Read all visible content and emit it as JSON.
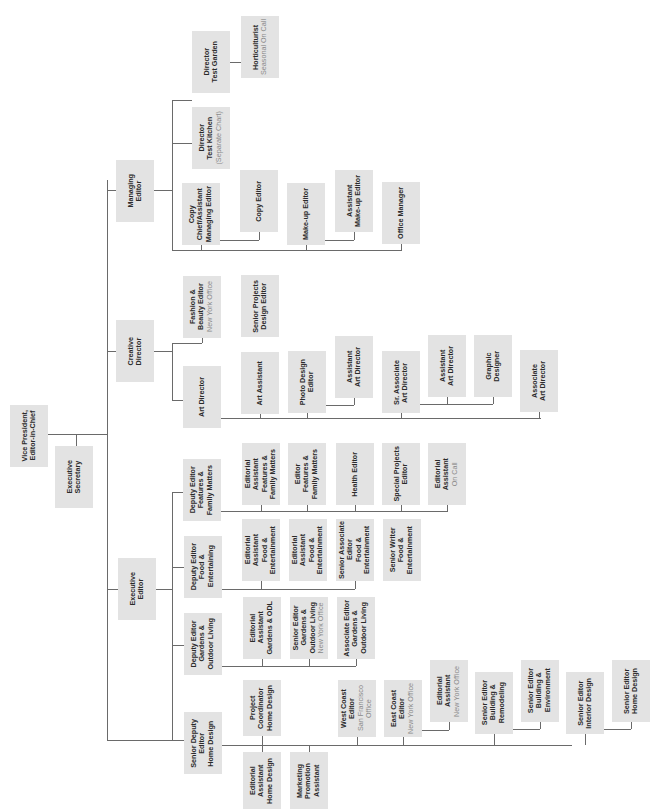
{
  "diagram": {
    "orientation": "rotated 90 degrees counterclockwise (text reads bottom-to-top)",
    "box_color": "#e3e3e3",
    "line_color": "#6a6a6a",
    "text_color": "#2a2a2a",
    "subtext_color": "#8a8a8a"
  },
  "nodes": [
    {
      "id": "vp",
      "title": "Vice President,\nEditor-in-Chief",
      "sub": "",
      "x": 10,
      "y": 405,
      "w": 38,
      "h": 62,
      "parent": null
    },
    {
      "id": "exec-sec",
      "title": "Executive\nSecretary",
      "sub": "",
      "x": 55,
      "y": 446,
      "w": 38,
      "h": 62,
      "parent": "vp"
    },
    {
      "id": "managing-editor",
      "title": "Managing\nEditor",
      "sub": "",
      "x": 116,
      "y": 160,
      "w": 38,
      "h": 62,
      "parent": "vp"
    },
    {
      "id": "creative-director",
      "title": "Creative\nDirector",
      "sub": "",
      "x": 116,
      "y": 320,
      "w": 38,
      "h": 62,
      "parent": "vp"
    },
    {
      "id": "executive-editor",
      "title": "Executive\nEditor",
      "sub": "",
      "x": 118,
      "y": 558,
      "w": 38,
      "h": 62,
      "parent": "vp"
    },
    {
      "id": "senior-deputy-home",
      "title": "Senior Deputy\nEditor\nHome Design",
      "sub": "",
      "x": 184,
      "y": 712,
      "w": 38,
      "h": 62,
      "parent": "executive-editor"
    },
    {
      "id": "dir-test-kitchen",
      "title": "Director\nTest Kitchen",
      "sub": "(Separate Chart)",
      "x": 192,
      "y": 107,
      "w": 38,
      "h": 62,
      "parent": "managing-editor"
    },
    {
      "id": "dir-test-garden",
      "title": "Director\nTest Garden",
      "sub": "",
      "x": 192,
      "y": 31,
      "w": 38,
      "h": 62,
      "parent": "managing-editor"
    },
    {
      "id": "horticulturist",
      "title": "Horticulturist",
      "sub": "Seasonal On Call",
      "x": 241,
      "y": 16,
      "w": 38,
      "h": 62,
      "parent": "dir-test-garden"
    },
    {
      "id": "copy-chief",
      "title": "Copy\nChief/Assistant\nManaging Editor",
      "sub": "",
      "x": 182,
      "y": 183,
      "w": 38,
      "h": 62,
      "parent": "managing-editor"
    },
    {
      "id": "copy-editor",
      "title": "Copy Editor",
      "sub": "",
      "x": 240,
      "y": 170,
      "w": 38,
      "h": 62,
      "parent": "copy-chief"
    },
    {
      "id": "makeup-editor",
      "title": "Make-up Editor",
      "sub": "",
      "x": 287,
      "y": 183,
      "w": 38,
      "h": 62,
      "parent": "managing-editor"
    },
    {
      "id": "asst-makeup-editor",
      "title": "Assistant\nMake-up Editor",
      "sub": "",
      "x": 335,
      "y": 170,
      "w": 38,
      "h": 62,
      "parent": "makeup-editor"
    },
    {
      "id": "office-manager",
      "title": "Office Manager",
      "sub": "",
      "x": 382,
      "y": 182,
      "w": 38,
      "h": 62,
      "parent": "managing-editor"
    },
    {
      "id": "fashion-beauty",
      "title": "Fashion &\nBeauty Editor",
      "sub": "New York Office",
      "x": 183,
      "y": 276,
      "w": 38,
      "h": 62,
      "parent": "creative-director"
    },
    {
      "id": "senior-projects-design",
      "title": "Senior Projects\nDesign Editor",
      "sub": "",
      "x": 241,
      "y": 275,
      "w": 38,
      "h": 62,
      "parent": "creative-director"
    },
    {
      "id": "art-director",
      "title": "Art Director",
      "sub": "",
      "x": 183,
      "y": 366,
      "w": 38,
      "h": 62,
      "parent": "creative-director"
    },
    {
      "id": "art-assistant",
      "title": "Art Assistant",
      "sub": "",
      "x": 241,
      "y": 352,
      "w": 38,
      "h": 62,
      "parent": "art-director"
    },
    {
      "id": "photo-design",
      "title": "Photo Design\nEditor",
      "sub": "",
      "x": 288,
      "y": 351,
      "w": 38,
      "h": 62,
      "parent": "art-director"
    },
    {
      "id": "asst-art-director-1",
      "title": "Assistant\nArt Director",
      "sub": "",
      "x": 335,
      "y": 336,
      "w": 38,
      "h": 62,
      "parent": "photo-design"
    },
    {
      "id": "sr-assoc-art-director",
      "title": "Sr. Associate\nArt Director",
      "sub": "",
      "x": 382,
      "y": 351,
      "w": 38,
      "h": 62,
      "parent": "art-director"
    },
    {
      "id": "asst-art-director-2",
      "title": "Assistant\nArt Director",
      "sub": "",
      "x": 428,
      "y": 335,
      "w": 38,
      "h": 62,
      "parent": "sr-assoc-art-director"
    },
    {
      "id": "graphic-designer",
      "title": "Graphic\nDesigner",
      "sub": "",
      "x": 474,
      "y": 335,
      "w": 38,
      "h": 62,
      "parent": "sr-assoc-art-director"
    },
    {
      "id": "assoc-art-director",
      "title": "Associate\nArt Director",
      "sub": "",
      "x": 520,
      "y": 350,
      "w": 38,
      "h": 62,
      "parent": "art-director"
    },
    {
      "id": "dep-features",
      "title": "Deputy Editor\nFeatures &\nFamily Matters",
      "sub": "",
      "x": 183,
      "y": 459,
      "w": 38,
      "h": 62,
      "parent": "executive-editor"
    },
    {
      "id": "ea-features",
      "title": "Editorial\nAssistant\nFeatures &\nFamily Matters",
      "sub": "",
      "x": 242,
      "y": 443,
      "w": 38,
      "h": 62,
      "parent": "dep-features"
    },
    {
      "id": "editor-features",
      "title": "Editor\nFeatures &\nFamily Matters",
      "sub": "",
      "x": 288,
      "y": 443,
      "w": 38,
      "h": 62,
      "parent": "dep-features"
    },
    {
      "id": "health-editor",
      "title": "Health Editor",
      "sub": "",
      "x": 336,
      "y": 443,
      "w": 38,
      "h": 62,
      "parent": "dep-features"
    },
    {
      "id": "special-projects",
      "title": "Special Projects\nEditor",
      "sub": "",
      "x": 382,
      "y": 443,
      "w": 38,
      "h": 62,
      "parent": "dep-features"
    },
    {
      "id": "ea-oncall",
      "title": "Editorial\nAssistant",
      "sub": "On Call",
      "x": 428,
      "y": 443,
      "w": 38,
      "h": 62,
      "parent": "dep-features"
    },
    {
      "id": "dep-food",
      "title": "Deputy Editor\nFood &\nEntertaining",
      "sub": "",
      "x": 184,
      "y": 536,
      "w": 38,
      "h": 62,
      "parent": "executive-editor"
    },
    {
      "id": "ea-food-1",
      "title": "Editorial\nAssistant\nFood &\nEntertainment",
      "sub": "",
      "x": 242,
      "y": 519,
      "w": 38,
      "h": 62,
      "parent": "dep-food"
    },
    {
      "id": "ea-food-2",
      "title": "Editorial\nAssistant\nFood &\nEntertainment",
      "sub": "",
      "x": 289,
      "y": 519,
      "w": 38,
      "h": 62,
      "parent": "dep-food"
    },
    {
      "id": "sr-assoc-food",
      "title": "Senior Associate\nEditor\nFood &\nEntertainment",
      "sub": "",
      "x": 336,
      "y": 519,
      "w": 38,
      "h": 62,
      "parent": "dep-food"
    },
    {
      "id": "sr-writer-food",
      "title": "Senior Writer\nFood &\nEntertainment",
      "sub": "",
      "x": 383,
      "y": 519,
      "w": 38,
      "h": 62,
      "parent": "dep-food"
    },
    {
      "id": "dep-gardens",
      "title": "Deputy Editor\nGardens &\nOutdoor Living",
      "sub": "",
      "x": 184,
      "y": 613,
      "w": 38,
      "h": 62,
      "parent": "executive-editor"
    },
    {
      "id": "ea-gardens",
      "title": "Editorial\nAssistant\nGardens & ODL",
      "sub": "",
      "x": 243,
      "y": 597,
      "w": 38,
      "h": 62,
      "parent": "dep-gardens"
    },
    {
      "id": "sr-editor-gardens",
      "title": "Senior Editor\nGardens &\nOutdoor Living",
      "sub": "New York Office",
      "x": 290,
      "y": 597,
      "w": 38,
      "h": 62,
      "parent": "dep-gardens"
    },
    {
      "id": "assoc-editor-gardens",
      "title": "Associate Editor\nGardens &\nOutdoor Living",
      "sub": "",
      "x": 337,
      "y": 597,
      "w": 38,
      "h": 62,
      "parent": "dep-gardens"
    },
    {
      "id": "project-coord-home",
      "title": "Project\nCoordinator\nHome Design",
      "sub": "",
      "x": 243,
      "y": 680,
      "w": 38,
      "h": 56,
      "parent": "senior-deputy-home"
    },
    {
      "id": "ea-home",
      "title": "Editorial\nAssistant\nHome Design",
      "sub": "",
      "x": 243,
      "y": 752,
      "w": 38,
      "h": 57,
      "parent": "senior-deputy-home"
    },
    {
      "id": "marketing-promo",
      "title": "Marketing\nPromotion\nAssistant",
      "sub": "",
      "x": 290,
      "y": 752,
      "w": 38,
      "h": 57,
      "parent": "senior-deputy-home"
    },
    {
      "id": "west-coast",
      "title": "West Coast Editor",
      "sub": "San Francisco Office",
      "x": 338,
      "y": 680,
      "w": 38,
      "h": 57,
      "parent": "senior-deputy-home"
    },
    {
      "id": "east-coast",
      "title": "East Coast Editor",
      "sub": "New York Office",
      "x": 384,
      "y": 680,
      "w": 38,
      "h": 57,
      "parent": "senior-deputy-home"
    },
    {
      "id": "ea-ny",
      "title": "Editorial Assistant",
      "sub": "New York Office",
      "x": 430,
      "y": 660,
      "w": 38,
      "h": 62,
      "parent": "east-coast"
    },
    {
      "id": "sr-editor-building-remodel",
      "title": "Senior Editor\nBuilding &\nRemodeling",
      "sub": "",
      "x": 475,
      "y": 672,
      "w": 38,
      "h": 62,
      "parent": "senior-deputy-home"
    },
    {
      "id": "sr-editor-building-env",
      "title": "Senior Editor\nBuilding &\nEnvironment",
      "sub": "",
      "x": 521,
      "y": 660,
      "w": 38,
      "h": 62,
      "parent": "sr-editor-building-remodel"
    },
    {
      "id": "sr-editor-interior",
      "title": "Senior Editor\nInterior Design",
      "sub": "",
      "x": 566,
      "y": 672,
      "w": 38,
      "h": 62,
      "parent": "senior-deputy-home"
    },
    {
      "id": "sr-editor-home-design",
      "title": "Senior Editor\nHome Design",
      "sub": "",
      "x": 612,
      "y": 660,
      "w": 38,
      "h": 62,
      "parent": "sr-editor-interior"
    }
  ],
  "connectors": [
    {
      "x": 48,
      "y": 434,
      "w": 60,
      "h": 1
    },
    {
      "x": 76,
      "y": 434,
      "w": 1,
      "h": 12
    },
    {
      "x": 107,
      "y": 180,
      "w": 1,
      "h": 560
    },
    {
      "x": 107,
      "y": 190,
      "w": 9,
      "h": 1
    },
    {
      "x": 107,
      "y": 351,
      "w": 9,
      "h": 1
    },
    {
      "x": 107,
      "y": 589,
      "w": 11,
      "h": 1
    },
    {
      "x": 107,
      "y": 740,
      "w": 77,
      "h": 1
    },
    {
      "x": 154,
      "y": 190,
      "w": 18,
      "h": 1
    },
    {
      "x": 172,
      "y": 100,
      "w": 1,
      "h": 150
    },
    {
      "x": 172,
      "y": 100,
      "w": 20,
      "h": 1
    },
    {
      "x": 172,
      "y": 143,
      "w": 20,
      "h": 1
    },
    {
      "x": 230,
      "y": 62,
      "w": 11,
      "h": 1
    },
    {
      "x": 172,
      "y": 250,
      "w": 230,
      "h": 1
    },
    {
      "x": 201,
      "y": 245,
      "w": 1,
      "h": 5
    },
    {
      "x": 220,
      "y": 240,
      "w": 39,
      "h": 1
    },
    {
      "x": 259,
      "y": 232,
      "w": 1,
      "h": 8
    },
    {
      "x": 306,
      "y": 245,
      "w": 1,
      "h": 5
    },
    {
      "x": 325,
      "y": 240,
      "w": 29,
      "h": 1
    },
    {
      "x": 354,
      "y": 232,
      "w": 1,
      "h": 8
    },
    {
      "x": 401,
      "y": 244,
      "w": 1,
      "h": 6
    },
    {
      "x": 154,
      "y": 351,
      "w": 18,
      "h": 1
    },
    {
      "x": 172,
      "y": 343,
      "w": 1,
      "h": 57
    },
    {
      "x": 172,
      "y": 343,
      "w": 30,
      "h": 1
    },
    {
      "x": 202,
      "y": 338,
      "w": 1,
      "h": 5
    },
    {
      "x": 172,
      "y": 400,
      "w": 11,
      "h": 1
    },
    {
      "x": 221,
      "y": 418,
      "w": 320,
      "h": 1
    },
    {
      "x": 260,
      "y": 414,
      "w": 1,
      "h": 4
    },
    {
      "x": 307,
      "y": 413,
      "w": 1,
      "h": 5
    },
    {
      "x": 326,
      "y": 405,
      "w": 28,
      "h": 1
    },
    {
      "x": 354,
      "y": 398,
      "w": 1,
      "h": 7
    },
    {
      "x": 401,
      "y": 413,
      "w": 1,
      "h": 5
    },
    {
      "x": 420,
      "y": 404,
      "w": 73,
      "h": 1
    },
    {
      "x": 447,
      "y": 397,
      "w": 1,
      "h": 7
    },
    {
      "x": 493,
      "y": 397,
      "w": 1,
      "h": 7
    },
    {
      "x": 539,
      "y": 412,
      "w": 1,
      "h": 6
    },
    {
      "x": 156,
      "y": 589,
      "w": 16,
      "h": 1
    },
    {
      "x": 172,
      "y": 492,
      "w": 1,
      "h": 248
    },
    {
      "x": 172,
      "y": 492,
      "w": 11,
      "h": 1
    },
    {
      "x": 172,
      "y": 567,
      "w": 12,
      "h": 1
    },
    {
      "x": 172,
      "y": 645,
      "w": 12,
      "h": 1
    },
    {
      "x": 221,
      "y": 511,
      "w": 227,
      "h": 1
    },
    {
      "x": 261,
      "y": 505,
      "w": 1,
      "h": 6
    },
    {
      "x": 307,
      "y": 505,
      "w": 1,
      "h": 6
    },
    {
      "x": 355,
      "y": 505,
      "w": 1,
      "h": 6
    },
    {
      "x": 401,
      "y": 505,
      "w": 1,
      "h": 6
    },
    {
      "x": 447,
      "y": 505,
      "w": 1,
      "h": 6
    },
    {
      "x": 222,
      "y": 589,
      "w": 133,
      "h": 1
    },
    {
      "x": 261,
      "y": 581,
      "w": 1,
      "h": 8
    },
    {
      "x": 355,
      "y": 581,
      "w": 1,
      "h": 8
    },
    {
      "x": 222,
      "y": 666,
      "w": 134,
      "h": 1
    },
    {
      "x": 262,
      "y": 659,
      "w": 1,
      "h": 7
    },
    {
      "x": 309,
      "y": 659,
      "w": 1,
      "h": 7
    },
    {
      "x": 356,
      "y": 659,
      "w": 1,
      "h": 7
    },
    {
      "x": 222,
      "y": 745,
      "w": 350,
      "h": 1
    },
    {
      "x": 262,
      "y": 736,
      "w": 1,
      "h": 16
    },
    {
      "x": 309,
      "y": 745,
      "w": 1,
      "h": 7
    },
    {
      "x": 357,
      "y": 737,
      "w": 1,
      "h": 8
    },
    {
      "x": 403,
      "y": 737,
      "w": 1,
      "h": 8
    },
    {
      "x": 422,
      "y": 730,
      "w": 27,
      "h": 1
    },
    {
      "x": 449,
      "y": 722,
      "w": 1,
      "h": 8
    },
    {
      "x": 494,
      "y": 734,
      "w": 1,
      "h": 11
    },
    {
      "x": 513,
      "y": 729,
      "w": 27,
      "h": 1
    },
    {
      "x": 540,
      "y": 722,
      "w": 1,
      "h": 7
    },
    {
      "x": 585,
      "y": 734,
      "w": 1,
      "h": 11
    },
    {
      "x": 604,
      "y": 729,
      "w": 27,
      "h": 1
    },
    {
      "x": 631,
      "y": 722,
      "w": 1,
      "h": 7
    }
  ]
}
